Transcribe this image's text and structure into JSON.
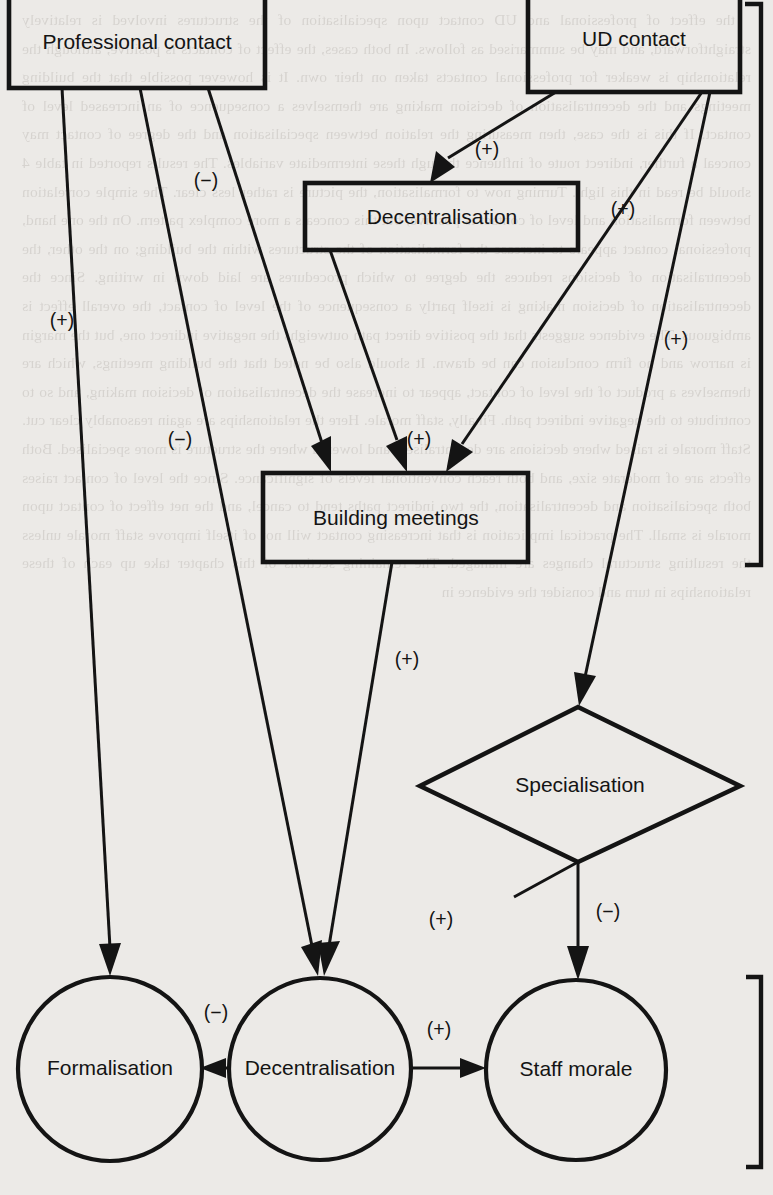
{
  "figure": {
    "kind": "causal-path-diagram",
    "background_color": "#eceae7",
    "ink_color": "#141414"
  },
  "nodes": [
    {
      "id": "professional-contact",
      "label": "Professional contact",
      "shape": "rectangle"
    },
    {
      "id": "ud-contact",
      "label": "UD contact",
      "shape": "rectangle"
    },
    {
      "id": "decentralisation-top",
      "label": "Decentralisation",
      "shape": "rectangle"
    },
    {
      "id": "building-meetings",
      "label": "Building meetings",
      "shape": "rectangle"
    },
    {
      "id": "specialisation",
      "label": "Specialisation",
      "shape": "diamond"
    },
    {
      "id": "formalisation",
      "label": "Formalisation",
      "shape": "circle"
    },
    {
      "id": "decentralisation-bottom",
      "label": "Decentralisation",
      "shape": "circle"
    },
    {
      "id": "staff-morale",
      "label": "Staff morale",
      "shape": "circle"
    }
  ],
  "edges": [
    {
      "id": "e1",
      "from": "professional-contact",
      "to": "formalisation",
      "sign": "(+)"
    },
    {
      "id": "e2",
      "from": "professional-contact",
      "to": "decentralisation-bottom",
      "sign": "(−)"
    },
    {
      "id": "e3",
      "from": "professional-contact",
      "to": "building-meetings",
      "sign": "(−)"
    },
    {
      "id": "e4",
      "from": "ud-contact",
      "to": "decentralisation-top",
      "sign": "(+)"
    },
    {
      "id": "e5",
      "from": "ud-contact",
      "to": "building-meetings",
      "sign": "(+)"
    },
    {
      "id": "e6",
      "from": "ud-contact",
      "to": "specialisation",
      "sign": "(+)"
    },
    {
      "id": "e7",
      "from": "decentralisation-top",
      "to": "building-meetings",
      "sign": "(+)"
    },
    {
      "id": "e8",
      "from": "building-meetings",
      "to": "decentralisation-bottom",
      "sign": "(+)"
    },
    {
      "id": "e9",
      "from": "specialisation",
      "to": "staff-morale",
      "sign": "(−)"
    },
    {
      "id": "e10",
      "from": "decentralisation-bottom",
      "to": "formalisation",
      "sign": "(−)"
    },
    {
      "id": "e11",
      "from": "decentralisation-bottom",
      "to": "staff-morale",
      "sign": "(+)"
    },
    {
      "id": "e12",
      "from": "specialisation",
      "to": "staff-morale-left",
      "sign": "(+)"
    }
  ],
  "signs": {
    "prof_to_formalisation": "(+)",
    "prof_to_decentralisation": "(−)",
    "prof_to_meetings": "(−)",
    "ud_to_decentralisation": "(+)",
    "ud_to_meetings": "(+)",
    "ud_to_specialisation": "(+)",
    "dec_to_meetings": "(+)",
    "meetings_to_decentralisation": "(+)",
    "spec_to_morale": "(−)",
    "spec_left": "(+)",
    "dec_to_formalisation": "(−)",
    "dec_to_morale": "(+)"
  },
  "brackets": [
    {
      "id": "upper-group-bracket",
      "side": "right"
    },
    {
      "id": "lower-group-bracket",
      "side": "right"
    }
  ],
  "bleed_through_text": [
    "the effect of professional and UD contact upon specialisation",
    "of the structures involved is relatively straightforward, and",
    "may be summarised as follows. In both cases, the effect of",
    "contacts is positive, although the relationship is weaker for",
    "professional contacts taken on their own. It is however",
    "possible that the building meetings and the decentralisation",
    "of decision making are themselves a consequence of an",
    "increased level of contact. If this is the case, then measuring",
    "the relation between specialisation and the degree of contact",
    "may conceal a further, indirect route of influence through",
    "these intermediate variables. The results reported in table 4",
    "should be read in this light.",
    "Turning now to formalisation, the picture is rather less",
    "clear. The simple correlation between formalisation and level",
    "of contact is positive, but this conceals a more complex",
    "pattern. On the one hand, professional contact appears to",
    "increase the formalisation of the structures within the",
    "building; on the other, the decentralisation of decisions",
    "reduces the degree to which procedures are laid down in",
    "writing. Since the decentralisation of decision making is",
    "itself partly a consequence of the level of contact, the",
    "overall effect is ambiguous. The evidence suggests that",
    "the positive direct path outweighs the negative indirect one,",
    "but the margin is narrow and no firm conclusion can be",
    "drawn. It should also be noted that the building meetings,",
    "which are themselves a product of the level of contact,",
    "appear to increase the decentralisation of decision making,",
    "and so to contribute to the negative indirect path.",
    "Finally, staff morale. Here the relationships are again",
    "reasonably clear cut. Staff morale is raised where decisions",
    "are decentralised, and lowered where the structure is more",
    "specialised. Both effects are of moderate size, and both",
    "reach conventional levels of significance. Since the level of",
    "contact raises both specialisation and decentralisation, the",
    "two indirect paths tend to cancel, and the net effect of",
    "contact upon morale is small. The practical implication",
    "is that increasing contact will not of itself improve staff",
    "morale unless the resulting structural changes are managed.",
    "The remaining sections of this chapter take up each of",
    "these relationships in turn and consider the evidence in"
  ]
}
